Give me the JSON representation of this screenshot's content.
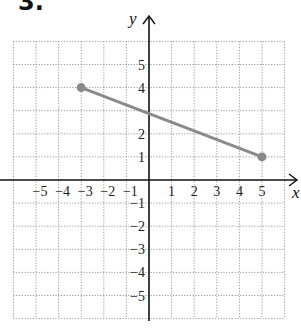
{
  "problem": {
    "number": "3."
  },
  "chart_data": {
    "type": "line",
    "title": "",
    "xlabel": "x",
    "ylabel": "y",
    "xlim": [
      -6,
      6
    ],
    "ylim": [
      -6,
      6
    ],
    "grid": true,
    "grid_style": "dotted",
    "x_tick_labels": [
      "-5",
      "-4",
      "-3",
      "-2",
      "-1",
      "1",
      "2",
      "3",
      "4",
      "5"
    ],
    "y_tick_labels": [
      "5",
      "4",
      "2",
      "1",
      "-1",
      "-2",
      "-3",
      "-4",
      "-5"
    ],
    "series": [
      {
        "name": "segment",
        "points": [
          [
            -3,
            4
          ],
          [
            5,
            1
          ]
        ],
        "color": "#8a8a8a",
        "endpoints": "filled-circle"
      }
    ]
  },
  "colors": {
    "segment": "#8a8a8a",
    "axis": "#111111",
    "grid": "#9a9a9a"
  }
}
